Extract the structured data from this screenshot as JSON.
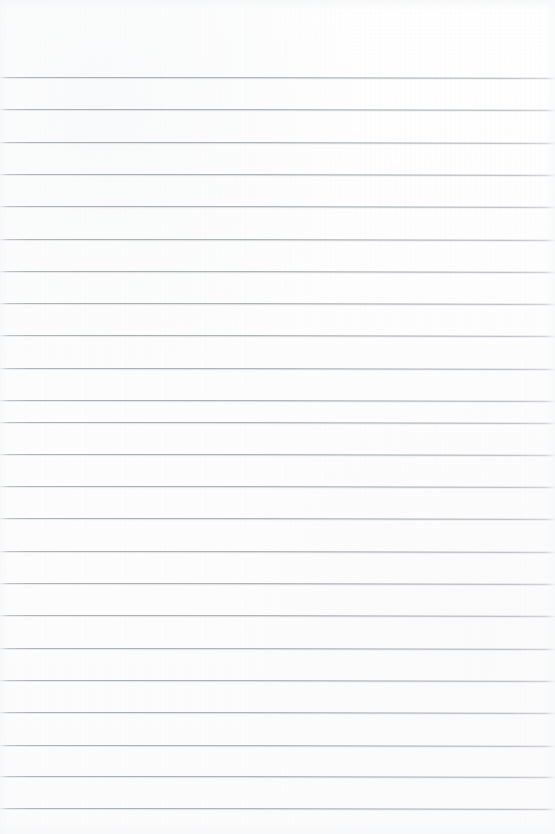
{
  "document": {
    "kind": "lined-paper-scan",
    "title": "",
    "page_width": 555,
    "page_height": 834,
    "background_color": "#fdfdfd",
    "is_blank": true,
    "written_text": "",
    "header_text": "",
    "footer_text": "",
    "page_number": ""
  },
  "ruling": {
    "line_color": "#a0a6ae",
    "line_shadow_color": "#cdd1d6",
    "line_thickness_px": 1,
    "line_spacing_px": 32.3,
    "first_line_y": 77,
    "last_line_y": 808,
    "line_count": 23,
    "margin_rule": false,
    "margin_rule_color": "",
    "top_margin_px": 77,
    "bottom_margin_px": 26,
    "lines_y": [
      77,
      109.3,
      141.6,
      173.9,
      206.2,
      238.5,
      270.8,
      303.1,
      335.4,
      367.7,
      400,
      421.5,
      453.8,
      486.1,
      518.4,
      550.7,
      583,
      615.3,
      647.6,
      679.9,
      712.2,
      744.5,
      775.5,
      808
    ],
    "line_tilt_deg": 0.08
  },
  "content": {
    "lines": [
      "",
      "",
      "",
      "",
      "",
      "",
      "",
      "",
      "",
      "",
      "",
      "",
      "",
      "",
      "",
      "",
      "",
      "",
      "",
      "",
      "",
      "",
      ""
    ]
  }
}
